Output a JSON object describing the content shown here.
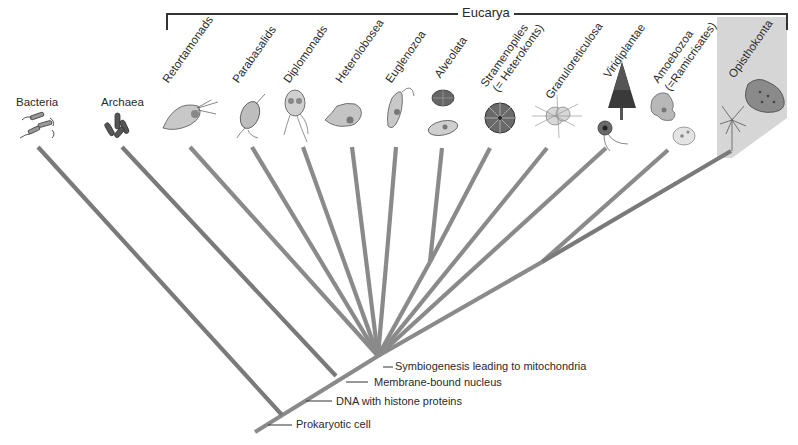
{
  "diagram": {
    "domain_bracket_label": "Eucarya",
    "colors": {
      "branch": "#8a8a8a",
      "branch_dark": "#7a7a7a",
      "text": "#2a2a2a",
      "opisthokont_shade": "#d4d4d4",
      "bracket": "#333333"
    },
    "prokaryote_groups": [
      {
        "label": "Bacteria",
        "icon": "bacteria-icon"
      },
      {
        "label": "Archaea",
        "icon": "archaea-icon"
      }
    ],
    "eukaryote_groups": [
      {
        "label": "Retortamonads",
        "icon": "retortamonad-icon"
      },
      {
        "label": "Parabasalids",
        "icon": "parabasalid-icon"
      },
      {
        "label": "Diplomonads",
        "icon": "diplomonad-icon"
      },
      {
        "label": "Heterolobosea",
        "icon": "heterolobosea-icon"
      },
      {
        "label": "Euglenozoa",
        "icon": "euglenozoa-icon"
      },
      {
        "label": "Alveolata",
        "icon": "alveolata-icon"
      },
      {
        "label": "Stramenopiles",
        "label2": "(= Heterokonts)",
        "icon": "stramenopile-icon"
      },
      {
        "label": "Granuloreticulosa",
        "icon": "granuloreticulosa-icon"
      },
      {
        "label": "Viridiplantae",
        "icon": "tree-icon"
      },
      {
        "label": "Amoebozoa",
        "label2": "(=Ramicrisates)",
        "icon": "amoeba-icon"
      },
      {
        "label": "Opisthokonta",
        "icon": "frog-icon"
      }
    ],
    "callouts": [
      {
        "label": "Symbiogenesis leading to mitochondria"
      },
      {
        "label": "Membrane-bound nucleus"
      },
      {
        "label": "DNA with histone proteins"
      },
      {
        "label": "Prokaryotic cell"
      }
    ]
  }
}
